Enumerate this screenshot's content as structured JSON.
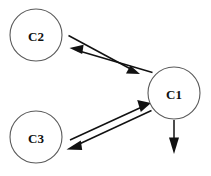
{
  "diagram": {
    "type": "node-link-diagram",
    "background_color": "#ffffff",
    "stroke_color": "#111111",
    "node_stroke_color": "#5a5a5a",
    "label_color": "#111111",
    "nodes": [
      {
        "id": "C2",
        "label": "C2",
        "cx": 36,
        "cy": 35,
        "r": 26
      },
      {
        "id": "C1",
        "label": "C1",
        "cx": 174,
        "cy": 93,
        "r": 26
      },
      {
        "id": "C3",
        "label": "C3",
        "cx": 36,
        "cy": 137,
        "r": 26
      }
    ],
    "edges": [
      {
        "id": "c2-to-c1",
        "from": "C2",
        "to": "C1",
        "direction": "forward",
        "style": "solid-arrow"
      },
      {
        "id": "c1-to-c2",
        "from": "C1",
        "to": "C2",
        "direction": "forward",
        "style": "solid-arrow"
      },
      {
        "id": "c3-to-c1",
        "from": "C3",
        "to": "C1",
        "direction": "forward",
        "style": "solid-arrow"
      },
      {
        "id": "c1-to-c3",
        "from": "C1",
        "to": "C3",
        "direction": "forward",
        "style": "solid-arrow"
      },
      {
        "id": "c1-out-down",
        "from": "C1",
        "to": "",
        "direction": "down",
        "style": "solid-arrow"
      }
    ]
  }
}
